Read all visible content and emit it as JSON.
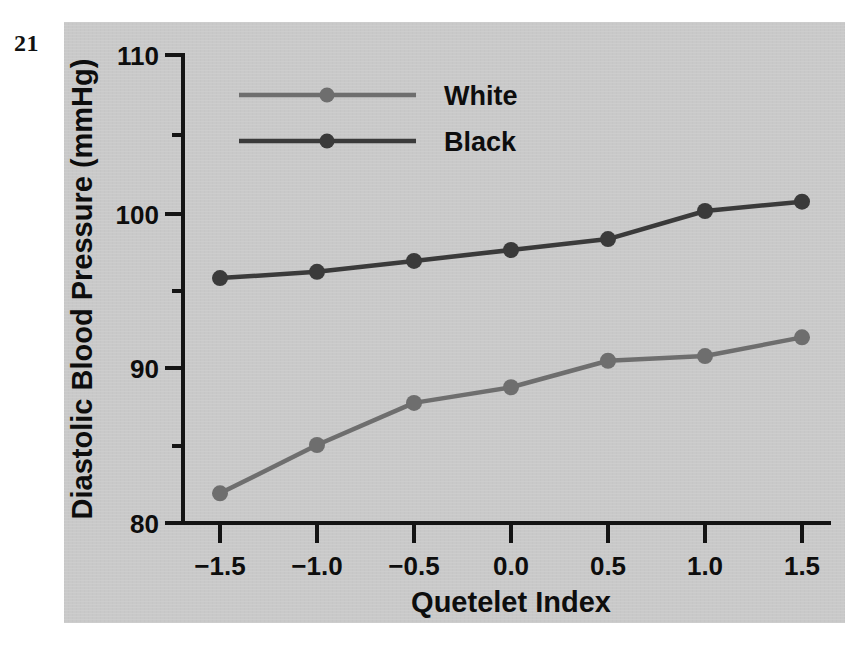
{
  "figure": {
    "number": "21"
  },
  "panel": {
    "background_color": "#c9c9c9"
  },
  "chart_data": {
    "type": "line",
    "title": "",
    "subtitle": "",
    "xlabel": "Quetelet Index",
    "ylabel": "Diastolic Blood Pressure (mmHg)",
    "x": [
      -1.5,
      -1.0,
      -0.5,
      0.0,
      0.5,
      1.0,
      1.5
    ],
    "xtick_labels": [
      "−1.5",
      "−1.0",
      "−0.5",
      "0.0",
      "0.5",
      "1.0",
      "1.5"
    ],
    "xlim": [
      -1.75,
      1.75
    ],
    "ylim": [
      80,
      110
    ],
    "ytick_labels": [
      "80",
      "90",
      "100",
      "110"
    ],
    "yticks": [
      80,
      90,
      100,
      110
    ],
    "yminor_ticks": [
      85,
      95,
      105
    ],
    "grid": false,
    "legend_position": "top-center",
    "series": [
      {
        "name": "White",
        "color": "#6e6e6e",
        "marker": "circle",
        "values": [
          81.9,
          85.0,
          87.7,
          88.7,
          90.4,
          90.7,
          91.9
        ]
      },
      {
        "name": "Black",
        "color": "#3a3a3a",
        "marker": "circle",
        "values": [
          95.7,
          96.1,
          96.8,
          97.5,
          98.2,
          100.0,
          100.6
        ]
      }
    ]
  }
}
